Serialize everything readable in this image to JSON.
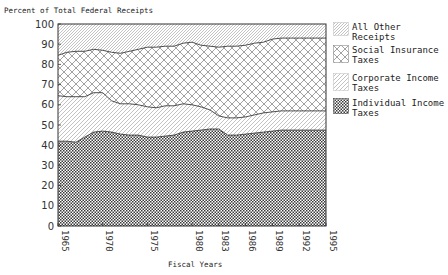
{
  "chart_data": {
    "type": "area",
    "stacked": true,
    "title": "",
    "ylabel": "Percent of Total Federal Receipts",
    "xlabel": "Fiscal Years",
    "ylim": [
      0,
      100
    ],
    "xlim": [
      1965,
      1995
    ],
    "yticks": [
      0,
      10,
      20,
      30,
      40,
      50,
      60,
      70,
      80,
      90,
      100
    ],
    "xticks": [
      1965,
      1970,
      1975,
      1980,
      1983,
      1986,
      1989,
      1992,
      1995
    ],
    "grid": false,
    "legend_position": "right",
    "x": [
      1965,
      1966,
      1967,
      1968,
      1969,
      1970,
      1971,
      1972,
      1973,
      1974,
      1975,
      1976,
      1977,
      1978,
      1979,
      1980,
      1981,
      1982,
      1983,
      1984,
      1985,
      1986,
      1987,
      1988,
      1989,
      1990,
      1991,
      1992,
      1993,
      1994,
      1995
    ],
    "series": [
      {
        "name": "Individual Income Taxes",
        "pattern": "dense-checker",
        "values": [
          42,
          42,
          41.5,
          44,
          46.5,
          47,
          46.5,
          45.5,
          45,
          45,
          44,
          44,
          44.5,
          45,
          46.5,
          47,
          47.5,
          48,
          48,
          45,
          45,
          45.5,
          46,
          46.5,
          47,
          47.5,
          47.5,
          47.5,
          47.5,
          47.5,
          47.5
        ]
      },
      {
        "name": "Corporate Income Taxes",
        "pattern": "light-diagonal",
        "values": [
          22.5,
          22,
          22.5,
          20,
          19.5,
          19,
          15.5,
          15,
          15.5,
          15,
          15,
          14.5,
          15,
          14.5,
          14,
          13,
          11.5,
          9.5,
          6.5,
          8.5,
          8.5,
          8.5,
          9,
          9.5,
          9.5,
          9.5,
          9.5,
          9.5,
          9.5,
          9.5,
          9.5
        ]
      },
      {
        "name": "Social Insurance Taxes",
        "pattern": "crosshatch",
        "values": [
          20,
          22,
          22.5,
          22.5,
          21.5,
          21,
          24,
          25,
          26,
          27.5,
          29.5,
          30,
          29.5,
          29.5,
          30,
          31,
          30.5,
          31.5,
          34,
          35.5,
          35.5,
          35.5,
          35.5,
          35,
          36,
          36,
          36,
          36,
          36,
          36,
          36
        ]
      },
      {
        "name": "All Other Receipts",
        "pattern": "fine-diagonal",
        "values": [
          15.5,
          14,
          13.5,
          13.5,
          12.5,
          13,
          14,
          14.5,
          13.5,
          12.5,
          11.5,
          11.5,
          11,
          11,
          9.5,
          9,
          10.5,
          11,
          11.5,
          11,
          11,
          10.5,
          9.5,
          9,
          7.5,
          7,
          7,
          7,
          7,
          7,
          7
        ]
      }
    ]
  },
  "axes": {
    "ylabel": "Percent of Total Federal Receipts",
    "xlabel": "Fiscal Years",
    "yticks": [
      "0",
      "10",
      "20",
      "30",
      "40",
      "50",
      "60",
      "70",
      "80",
      "90",
      "100"
    ],
    "xticks": [
      "1965",
      "1970",
      "1975",
      "1980",
      "1983",
      "1986",
      "1989",
      "1992",
      "1995"
    ]
  },
  "legend": {
    "items": [
      {
        "label": "All Other Receipts",
        "pattern": "fine-diagonal"
      },
      {
        "label": "Social Insurance\nTaxes",
        "pattern": "crosshatch"
      },
      {
        "label": "Corporate Income\nTaxes",
        "pattern": "light-diagonal"
      },
      {
        "label": "Individual Income\nTaxes",
        "pattern": "dense-checker"
      }
    ]
  },
  "colors": {
    "line": "#3a3a3a",
    "pattern_ink": "#555555",
    "axis": "#333333"
  }
}
